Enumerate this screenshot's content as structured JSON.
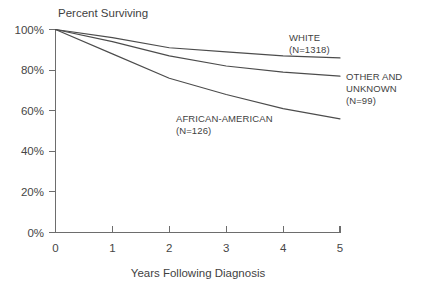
{
  "chart_data": {
    "type": "line",
    "title": "",
    "ylabel": "Percent Surviving",
    "xlabel": "Years Following Diagnosis",
    "x": [
      0,
      1,
      2,
      3,
      4,
      5
    ],
    "xlim": [
      0,
      5
    ],
    "ylim": [
      0,
      100
    ],
    "xticks": [
      "0",
      "1",
      "2",
      "3",
      "4",
      "5"
    ],
    "yticks": [
      "0%",
      "20%",
      "40%",
      "60%",
      "80%",
      "100%"
    ],
    "grid": false,
    "legend_position": "inline-right",
    "series": [
      {
        "name": "WHITE",
        "n_label": "(N=1318)",
        "label_line1": "WHITE",
        "label_line2": "(N=1318)",
        "values": [
          100,
          96,
          91,
          89,
          87,
          86
        ]
      },
      {
        "name": "OTHER AND UNKNOWN",
        "n_label": "(N=99)",
        "label_line1": "OTHER AND",
        "label_line2": "UNKNOWN",
        "label_line3": "(N=99)",
        "values": [
          100,
          94,
          87,
          82,
          79,
          77
        ]
      },
      {
        "name": "AFRICAN-AMERICAN",
        "n_label": "(N=126)",
        "label_line1": "AFRICAN-AMERICAN",
        "label_line2": "(N=126)",
        "values": [
          100,
          88,
          76,
          68,
          61,
          56
        ]
      }
    ],
    "colors": {
      "line": "#4c4c4c",
      "axis": "#6d6d6d",
      "text": "#3f3f3f",
      "background": "#ffffff"
    }
  },
  "axis": {
    "y_tick_0": "0%",
    "y_tick_1": "20%",
    "y_tick_2": "40%",
    "y_tick_3": "60%",
    "y_tick_4": "80%",
    "y_tick_5": "100%",
    "x_tick_0": "0",
    "x_tick_1": "1",
    "x_tick_2": "2",
    "x_tick_3": "3",
    "x_tick_4": "4",
    "x_tick_5": "5",
    "y_axis_title": "Percent Surviving",
    "x_axis_title": "Years Following Diagnosis"
  },
  "annotations": {
    "white_line1": "WHITE",
    "white_line2": "(N=1318)",
    "other_line1": "OTHER AND",
    "other_line2": "UNKNOWN",
    "other_line3": "(N=99)",
    "african_line1": "AFRICAN-AMERICAN",
    "african_line2": "(N=126)"
  }
}
